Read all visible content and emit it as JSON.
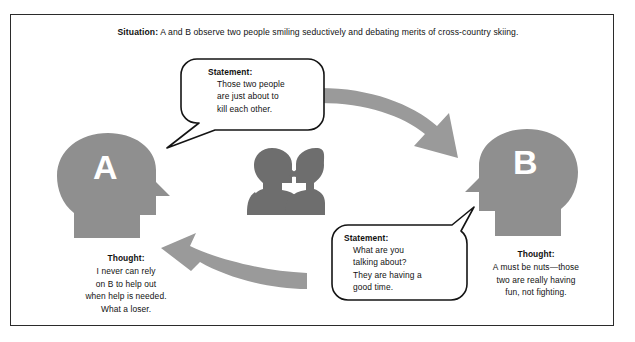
{
  "diagram": {
    "title_caption": {
      "lead": "Situation:",
      "text": " A and B observe two people smiling seductively and debating merits of cross-country skiing."
    },
    "person_a": {
      "letter": "A",
      "thought_label": "Thought:",
      "thought_lines": "I never can rely\non B to help out\nwhen help is needed.\nWhat a loser."
    },
    "person_b": {
      "letter": "B",
      "thought_label": "Thought:",
      "thought_lines": "A must be nuts—those\ntwo are really having\nfun, not fighting."
    },
    "statement_a": {
      "label": "Statement:",
      "lines": "Those two people\nare just about to\nkill each other."
    },
    "statement_b": {
      "label": "Statement:",
      "lines": "What are you\ntalking about?\nThey are having a\ngood time."
    },
    "colors": {
      "silhouette_gray": "#8f8f8f",
      "center_figure_gray": "#6e6e6e",
      "arrow_gray": "#9a9a9a",
      "frame_border": "#2b2b2b",
      "background": "#ffffff",
      "text": "#111111"
    }
  }
}
